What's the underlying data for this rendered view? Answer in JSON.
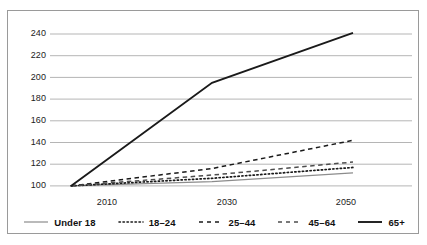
{
  "chart_data": {
    "type": "line",
    "title": "",
    "subtitle": "",
    "xlabel": "",
    "ylabel": "",
    "x": [
      2010,
      2030,
      2050
    ],
    "xtick_labels": [
      "2010",
      "2030",
      "2050"
    ],
    "ytick_labels": [
      "100",
      "120",
      "140",
      "160",
      "180",
      "200",
      "220",
      "240"
    ],
    "yticks": [
      100,
      120,
      140,
      160,
      180,
      200,
      220,
      240
    ],
    "ylim": [
      95,
      248
    ],
    "xlim": [
      2010,
      2050
    ],
    "grid": "horizontal",
    "legend_position": "bottom",
    "series": [
      {
        "name": "Under 18",
        "values": [
          100,
          104,
          112
        ],
        "style": "solid-thin",
        "color": "#8c8c8c"
      },
      {
        "name": "18–24",
        "values": [
          100,
          107,
          117
        ],
        "style": "dotted",
        "color": "#1a1a1a"
      },
      {
        "name": "25–44",
        "values": [
          100,
          116,
          142
        ],
        "style": "dashed",
        "color": "#1a1a1a"
      },
      {
        "name": "45–64",
        "values": [
          100,
          110,
          122
        ],
        "style": "dashed",
        "color": "#4d4d4d"
      },
      {
        "name": "65+",
        "values": [
          100,
          195,
          241
        ],
        "style": "solid-thick",
        "color": "#1a1a1a"
      }
    ]
  },
  "legend": {
    "items": [
      {
        "label": "Under 18"
      },
      {
        "label": "18–24"
      },
      {
        "label": "25–44"
      },
      {
        "label": "45–64"
      },
      {
        "label": "65+"
      }
    ]
  },
  "axes": {
    "y": {
      "labels": [
        "240",
        "220",
        "200",
        "180",
        "160",
        "140",
        "120",
        "100"
      ]
    },
    "x": {
      "labels": [
        "2010",
        "2030",
        "2050"
      ]
    }
  },
  "colors": {
    "border": "#9a9a9a",
    "gridline": "#b5b5b5",
    "line_dark": "#1a1a1a",
    "line_grey": "#8c8c8c",
    "text": "#222222"
  }
}
